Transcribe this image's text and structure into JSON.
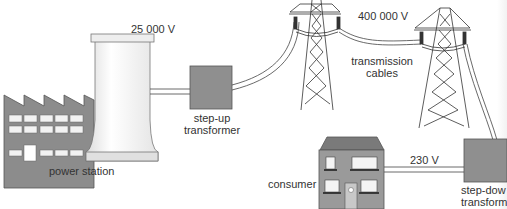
{
  "diagram": {
    "labels": {
      "power_station": "power station",
      "step_up_voltage": "25 000 V",
      "step_up_line1": "step-up",
      "step_up_line2": "transformer",
      "transmission_voltage": "400 000 V",
      "transmission_line1": "transmission",
      "transmission_line2": "cables",
      "consumer": "consumer",
      "consumer_voltage": "230 V",
      "step_down_line1": "step-dow",
      "step_down_line2": "transform"
    },
    "colors": {
      "building_gray": "#8c8c8c",
      "transformer_gray": "#8f8f8f",
      "house_gray": "#9a9a9a",
      "roof_gray": "#7a7a7a",
      "line": "#333333",
      "cooling_tower": "#f4f4f4"
    }
  }
}
